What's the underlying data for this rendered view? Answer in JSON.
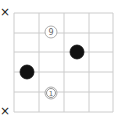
{
  "diagram": {
    "type": "go-board-fragment",
    "grid": {
      "x_lines": [
        14,
        39,
        64,
        89,
        113
      ],
      "y_lines": [
        13,
        33,
        52,
        72,
        92,
        112
      ],
      "line_color": "#cccccc"
    },
    "stones": [
      {
        "color": "white",
        "label": "9",
        "x": 51,
        "y": 32
      },
      {
        "color": "black",
        "label": "",
        "x": 77,
        "y": 52
      },
      {
        "color": "black",
        "label": "",
        "x": 27,
        "y": 72
      },
      {
        "color": "white",
        "label": "1",
        "x": 51,
        "y": 93,
        "marked": true
      }
    ],
    "margin_marks": [
      {
        "symbol": "×",
        "x": 0,
        "y": 6
      },
      {
        "symbol": "×",
        "x": 0,
        "y": 105
      }
    ]
  }
}
